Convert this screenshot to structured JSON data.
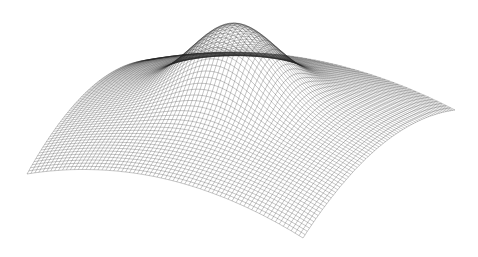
{
  "chart_data": {
    "type": "surface-wireframe",
    "title": "",
    "xlabel": "",
    "ylabel": "",
    "zlabel": "",
    "axes_visible": false,
    "grid_resolution": 70,
    "function": "z = a*exp(-(x^2+y^2)/(2*s^2)) + b*(1 - (x^2+y^2)/2)",
    "peak_center": [
      0,
      0
    ],
    "x_range": [
      -1,
      1
    ],
    "y_range": [
      -1,
      1
    ],
    "params": {
      "a": 0.55,
      "s": 0.28,
      "b": 0.45
    },
    "line_color": "#222222",
    "background": "#ffffff",
    "projection": {
      "corner_left": [
        27,
        174
      ],
      "corner_back": [
        150,
        60
      ],
      "corner_right": [
        455,
        110
      ],
      "corner_front": [
        303,
        238
      ],
      "z_scale": 120
    }
  }
}
